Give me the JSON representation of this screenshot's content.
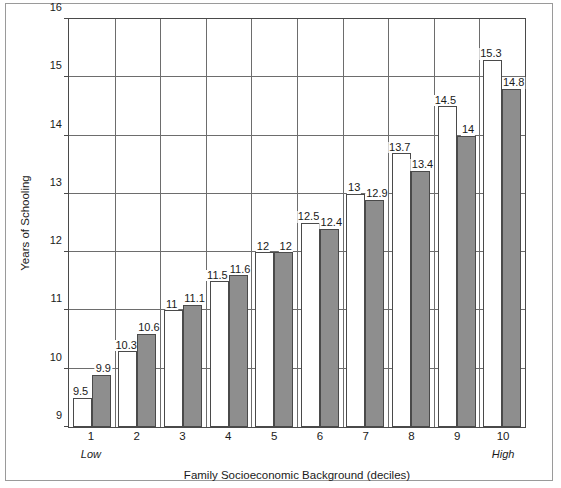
{
  "chart_data": {
    "type": "bar",
    "title": "",
    "xlabel": "Family Socioeconomic Background (deciles)",
    "ylabel": "Years of Schooling",
    "categories": [
      "1",
      "2",
      "3",
      "4",
      "5",
      "6",
      "7",
      "8",
      "9",
      "10"
    ],
    "ylim": [
      9,
      16
    ],
    "yticks": [
      9,
      10,
      11,
      12,
      13,
      14,
      15,
      16
    ],
    "ytick_labels": [
      "9",
      "10",
      "11",
      "12",
      "13",
      "14",
      "15",
      "16"
    ],
    "grid": "horizontal",
    "legend": "none",
    "series": [
      {
        "name": "white-bar",
        "style": "white-filled-outlined",
        "values": [
          9.5,
          10.3,
          11,
          11.5,
          12,
          12.5,
          13,
          13.7,
          14.5,
          15.3
        ],
        "labels": [
          "9.5",
          "10.3",
          "11",
          "11.5",
          "12",
          "12.5",
          "13",
          "13.7",
          "14.5",
          "15.3"
        ]
      },
      {
        "name": "gray-bar",
        "style": "gray-filled",
        "values": [
          9.9,
          10.6,
          11.1,
          11.6,
          12,
          12.4,
          12.9,
          13.4,
          14,
          14.8
        ],
        "labels": [
          "9.9",
          "10.6",
          "11.1",
          "11.6",
          "12",
          "12.4",
          "12.9",
          "13.4",
          "14",
          "14.8"
        ]
      }
    ],
    "annotations": [
      {
        "text": "Low",
        "position": "below-axis-left",
        "style": "italic"
      },
      {
        "text": "High",
        "position": "below-axis-right",
        "style": "italic"
      }
    ],
    "colors": {
      "gray_bar_fill": "#8e8e8e",
      "white_bar_fill": "#ffffff",
      "bar_outline": "#4a4a4a",
      "gridline": "#6d6d6d",
      "axis": "#4a4a4a",
      "frame": "#9a9a9a",
      "text": "#1a1a1a",
      "background": "#ffffff"
    }
  },
  "axis": {
    "x_annotation_low": "Low",
    "x_annotation_high": "High"
  }
}
